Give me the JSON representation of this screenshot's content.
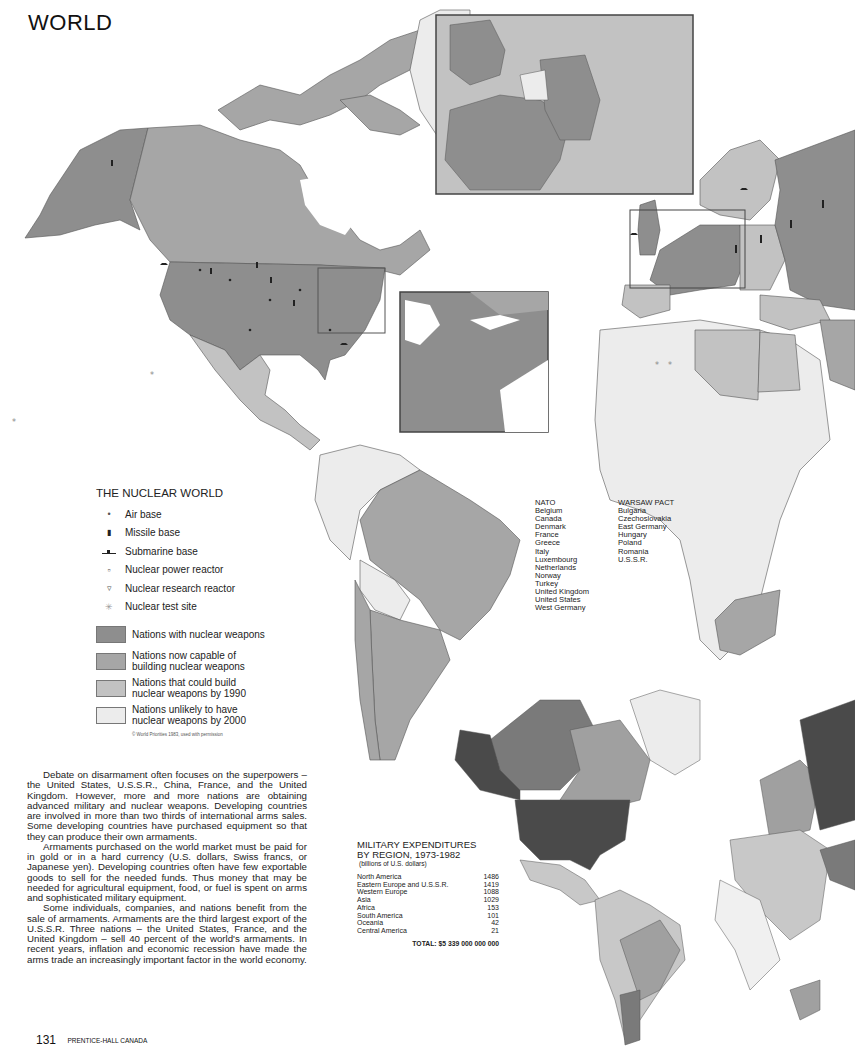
{
  "page": {
    "title": "WORLD",
    "page_number": "131",
    "publisher": "PRENTICE-HALL CANADA"
  },
  "colors": {
    "nuclear_weapons": "#8e8e8e",
    "capable_now": "#a6a6a6",
    "could_build_1990": "#c2c2c2",
    "unlikely_2000": "#ececec",
    "water": "#ffffff",
    "border": "#555555",
    "exp_highest": "#4a4a4a",
    "exp_high": "#7a7a7a",
    "exp_mid": "#a0a0a0",
    "exp_low": "#c8c8c8",
    "exp_lowest": "#f0f0f0"
  },
  "legend": {
    "title": "THE NUCLEAR WORLD",
    "symbols": [
      {
        "icon": "air-base-icon",
        "glyph": "•",
        "label": "Air base"
      },
      {
        "icon": "missile-base-icon",
        "glyph": "▮",
        "label": "Missile base"
      },
      {
        "icon": "submarine-base-icon",
        "glyph": "▲",
        "label": "Submarine base"
      },
      {
        "icon": "nuclear-power-reactor-icon",
        "glyph": "▫",
        "label": "Nuclear power reactor"
      },
      {
        "icon": "nuclear-research-reactor-icon",
        "glyph": "▿",
        "label": "Nuclear research reactor"
      },
      {
        "icon": "nuclear-test-site-icon",
        "glyph": "✳",
        "label": "Nuclear test site"
      }
    ],
    "categories": [
      {
        "label_1": "Nations with nuclear weapons",
        "label_2": "",
        "color": "#8e8e8e"
      },
      {
        "label_1": "Nations now capable of",
        "label_2": "building nuclear weapons",
        "color": "#a6a6a6"
      },
      {
        "label_1": "Nations that could build",
        "label_2": "nuclear weapons by 1990",
        "color": "#c2c2c2"
      },
      {
        "label_1": "Nations unlikely to have",
        "label_2": "nuclear weapons by 2000",
        "color": "#ececec"
      }
    ],
    "credit": "© World Priorities 1983, used with permission"
  },
  "alliances": {
    "nato": {
      "title": "NATO",
      "members": [
        "Belgium",
        "Canada",
        "Denmark",
        "France",
        "Greece",
        "Italy",
        "Luxembourg",
        "Netherlands",
        "Norway",
        "Turkey",
        "United Kingdom",
        "United States",
        "West Germany"
      ]
    },
    "warsaw": {
      "title": "WARSAW PACT",
      "members": [
        "Bulgaria",
        "Czechoslovakia",
        "East Germany",
        "Hungary",
        "Poland",
        "Romania",
        "U.S.S.R."
      ]
    }
  },
  "expenditures": {
    "title_1": "MILITARY EXPENDITURES",
    "title_2": "BY REGION, 1973-1982",
    "subtitle": "(billions of U.S. dollars)",
    "rows": [
      {
        "region": "North America",
        "value": "1486"
      },
      {
        "region": "Eastern Europe and U.S.S.R.",
        "value": "1419"
      },
      {
        "region": "Western Europe",
        "value": "1088"
      },
      {
        "region": "Asia",
        "value": "1029"
      },
      {
        "region": "Africa",
        "value": "153"
      },
      {
        "region": "South America",
        "value": "101"
      },
      {
        "region": "Oceania",
        "value": "42"
      },
      {
        "region": "Central America",
        "value": "21"
      }
    ],
    "total": "TOTAL: $5 339 000 000 000"
  },
  "body": {
    "p1": "Debate on disarmament often focuses on the superpowers – the United States, U.S.S.R., China, France, and the United Kingdom. However, more and more nations are obtaining advanced military and nuclear weapons. Developing countries are involved in more than two thirds of international arms sales. Some developing countries have purchased equipment so that they can produce their own armaments.",
    "p2": "Armaments purchased on the world market must be paid for in gold or in a hard currency (U.S. dollars, Swiss francs, or Japanese yen). Developing countries often have few exportable goods to sell for the needed funds. Thus money that may be needed for agricultural equipment, food, or fuel is spent on arms and sophisticated military equipment.",
    "p3": "Some individuals, companies, and nations benefit from the sale of armaments. Armaments are the third largest export of the U.S.S.R. Three nations – the United States, France, and the United Kingdom – sell 40 percent of the world's armaments. In recent years, inflation and economic recession have made the arms trade an increasingly important factor in the world economy."
  },
  "insets": [
    {
      "name": "western-europe-inset",
      "label": "Western Europe detail"
    },
    {
      "name": "northeast-us-inset",
      "label": "Northeastern United States detail"
    }
  ]
}
